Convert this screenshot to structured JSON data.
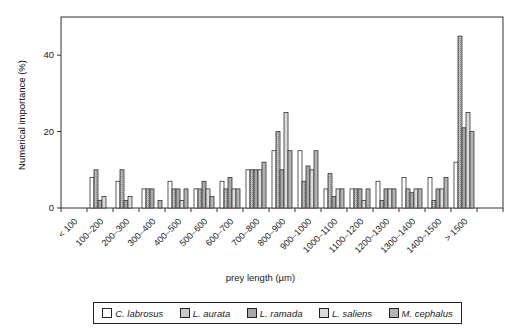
{
  "chart_data": {
    "type": "bar",
    "title": "",
    "xlabel": "prey length (µm)",
    "ylabel": "Numerical importance (%)",
    "ylim": [
      0,
      50
    ],
    "yticks": [
      0,
      20,
      40
    ],
    "grid": false,
    "legend_position": "bottom",
    "categories": [
      "< 100",
      "100–200",
      "200–300",
      "300–400",
      "400–500",
      "500–600",
      "600–700",
      "700–800",
      "800–900",
      "900–1000",
      "1000–1100",
      "1100–1200",
      "1200–1300",
      "1300–1400",
      "1400–1500",
      "> 1500"
    ],
    "series": [
      {
        "name": "C. labrosus",
        "fill": "#ffffff",
        "values": [
          0,
          8,
          7,
          5,
          7,
          5,
          7,
          10,
          15,
          15,
          5,
          5,
          7,
          8,
          8,
          12
        ]
      },
      {
        "name": "L. aurata",
        "fill": "#c8c8c8",
        "values": [
          0,
          10,
          10,
          5,
          5,
          5,
          5,
          10,
          20,
          7,
          9,
          5,
          2,
          5,
          2,
          45
        ]
      },
      {
        "name": "L. ramada",
        "fill": "#a8a8a8",
        "values": [
          0,
          2,
          2,
          5,
          5,
          7,
          8,
          10,
          10,
          11,
          3,
          5,
          5,
          4,
          5,
          21
        ]
      },
      {
        "name": "L. saliens",
        "fill": "#dcdcdc",
        "values": [
          0,
          3,
          3,
          0,
          2,
          5,
          5,
          10,
          25,
          10,
          5,
          2,
          5,
          5,
          5,
          25
        ]
      },
      {
        "name": "M. cephalus",
        "fill": "#b4b4b4",
        "values": [
          0,
          0,
          0,
          2,
          5,
          3,
          5,
          12,
          15,
          15,
          5,
          5,
          5,
          5,
          8,
          20
        ]
      }
    ]
  },
  "legend": {
    "items": [
      {
        "label": "C. labrosus",
        "fill": "#ffffff"
      },
      {
        "label": "L. aurata",
        "fill": "#c8c8c8"
      },
      {
        "label": "L. ramada",
        "fill": "#a8a8a8"
      },
      {
        "label": "L. saliens",
        "fill": "#dcdcdc"
      },
      {
        "label": "M. cephalus",
        "fill": "#b4b4b4"
      }
    ]
  }
}
